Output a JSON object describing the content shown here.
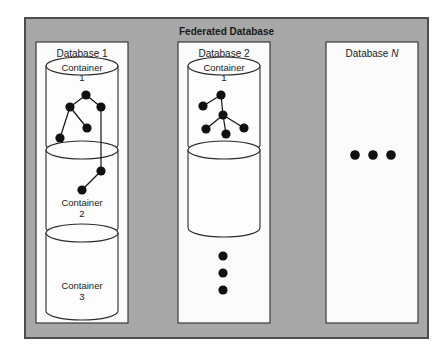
{
  "figure": {
    "title": "Federated Database",
    "background_color": "#ffffff",
    "frame_fill": "#a8a8a8",
    "frame_stroke": "#4d4d4d",
    "panel_fill": "#fbfbfb",
    "panel_stroke": "#3a3a3a",
    "cylinder_fill": "#fdfdfd",
    "cylinder_stroke": "#2b2b2b",
    "node_color": "#111111",
    "edge_color": "#111111"
  },
  "frame": {
    "x": 25,
    "y": 18,
    "width": 403,
    "height": 320
  },
  "databases": [
    {
      "id": "database-1",
      "label": "Database 1",
      "label_italic_suffix": "",
      "panel": {
        "x": 36,
        "y": 42,
        "width": 92,
        "height": 281
      },
      "label_pos": {
        "x": 82,
        "y": 57
      },
      "containers": [
        {
          "id": "container-1",
          "label_line1": "Container",
          "label_line2": "1",
          "label_inside_top": true,
          "cx": 82,
          "top_y": 66,
          "bottom_y": 145,
          "rx": 36,
          "ry": 9,
          "label_y1": 71,
          "label_y2": 81
        },
        {
          "id": "container-2",
          "label_line1": "Container",
          "label_line2": "2",
          "label_inside_top": false,
          "cx": 82,
          "top_y": 150,
          "bottom_y": 228,
          "rx": 36,
          "ry": 9,
          "label_y1": 206,
          "label_y2": 217
        },
        {
          "id": "container-3",
          "label_line1": "Container",
          "label_line2": "3",
          "label_inside_top": false,
          "cx": 82,
          "top_y": 233,
          "bottom_y": 311,
          "rx": 36,
          "ry": 9,
          "label_y1": 289,
          "label_y2": 300
        }
      ],
      "graph": {
        "nodes": [
          {
            "id": "d1n1",
            "x": 86,
            "y": 95,
            "r": 4.6
          },
          {
            "id": "d1n2",
            "x": 70,
            "y": 107,
            "r": 4.6
          },
          {
            "id": "d1n3",
            "x": 101,
            "y": 107,
            "r": 4.6
          },
          {
            "id": "d1n4",
            "x": 87,
            "y": 128,
            "r": 4.6
          },
          {
            "id": "d1n5",
            "x": 60,
            "y": 138,
            "r": 4.6
          },
          {
            "id": "d1n6",
            "x": 101,
            "y": 171,
            "r": 4.6
          },
          {
            "id": "d1n7",
            "x": 82,
            "y": 190,
            "r": 4.6
          }
        ],
        "edges": [
          {
            "from": "d1n1",
            "to": "d1n2"
          },
          {
            "from": "d1n1",
            "to": "d1n3"
          },
          {
            "from": "d1n2",
            "to": "d1n4"
          },
          {
            "from": "d1n2",
            "to": "d1n5"
          },
          {
            "from": "d1n3",
            "to": "d1n6"
          },
          {
            "from": "d1n6",
            "to": "d1n7"
          }
        ]
      },
      "ellipsis": null
    },
    {
      "id": "database-2",
      "label": "Database 2",
      "label_italic_suffix": "",
      "panel": {
        "x": 178,
        "y": 42,
        "width": 92,
        "height": 281
      },
      "label_pos": {
        "x": 224,
        "y": 57
      },
      "containers": [
        {
          "id": "container-1",
          "label_line1": "Container",
          "label_line2": "1",
          "label_inside_top": true,
          "cx": 224,
          "top_y": 66,
          "bottom_y": 145,
          "rx": 36,
          "ry": 9,
          "label_y1": 71,
          "label_y2": 81
        },
        {
          "id": "container-2",
          "label_line1": "",
          "label_line2": "",
          "label_inside_top": false,
          "cx": 224,
          "top_y": 150,
          "bottom_y": 228,
          "rx": 36,
          "ry": 9,
          "label_y1": 206,
          "label_y2": 217
        }
      ],
      "graph": {
        "nodes": [
          {
            "id": "d2n1",
            "x": 221,
            "y": 95,
            "r": 4.6
          },
          {
            "id": "d2n2",
            "x": 203,
            "y": 106,
            "r": 4.6
          },
          {
            "id": "d2n3",
            "x": 223,
            "y": 115,
            "r": 4.6
          },
          {
            "id": "d2n4",
            "x": 206,
            "y": 129,
            "r": 4.6
          },
          {
            "id": "d2n5",
            "x": 226,
            "y": 134,
            "r": 4.6
          },
          {
            "id": "d2n6",
            "x": 244,
            "y": 128,
            "r": 4.6
          }
        ],
        "edges": [
          {
            "from": "d2n1",
            "to": "d2n2"
          },
          {
            "from": "d2n1",
            "to": "d2n3"
          },
          {
            "from": "d2n3",
            "to": "d2n4"
          },
          {
            "from": "d2n3",
            "to": "d2n5"
          },
          {
            "from": "d2n3",
            "to": "d2n6"
          }
        ]
      },
      "ellipsis": {
        "orientation": "vertical",
        "count": 3,
        "cx": 223,
        "start_y": 256,
        "spacing": 17,
        "r": 4.6
      }
    },
    {
      "id": "database-n",
      "label": "Database ",
      "label_italic_suffix": "N",
      "panel": {
        "x": 326,
        "y": 42,
        "width": 92,
        "height": 281
      },
      "label_pos": {
        "x": 372,
        "y": 57
      },
      "containers": [],
      "graph": {
        "nodes": [],
        "edges": []
      },
      "ellipsis": {
        "orientation": "horizontal",
        "count": 3,
        "cy": 155,
        "start_x": 355,
        "spacing": 18,
        "r": 4.8
      }
    }
  ]
}
